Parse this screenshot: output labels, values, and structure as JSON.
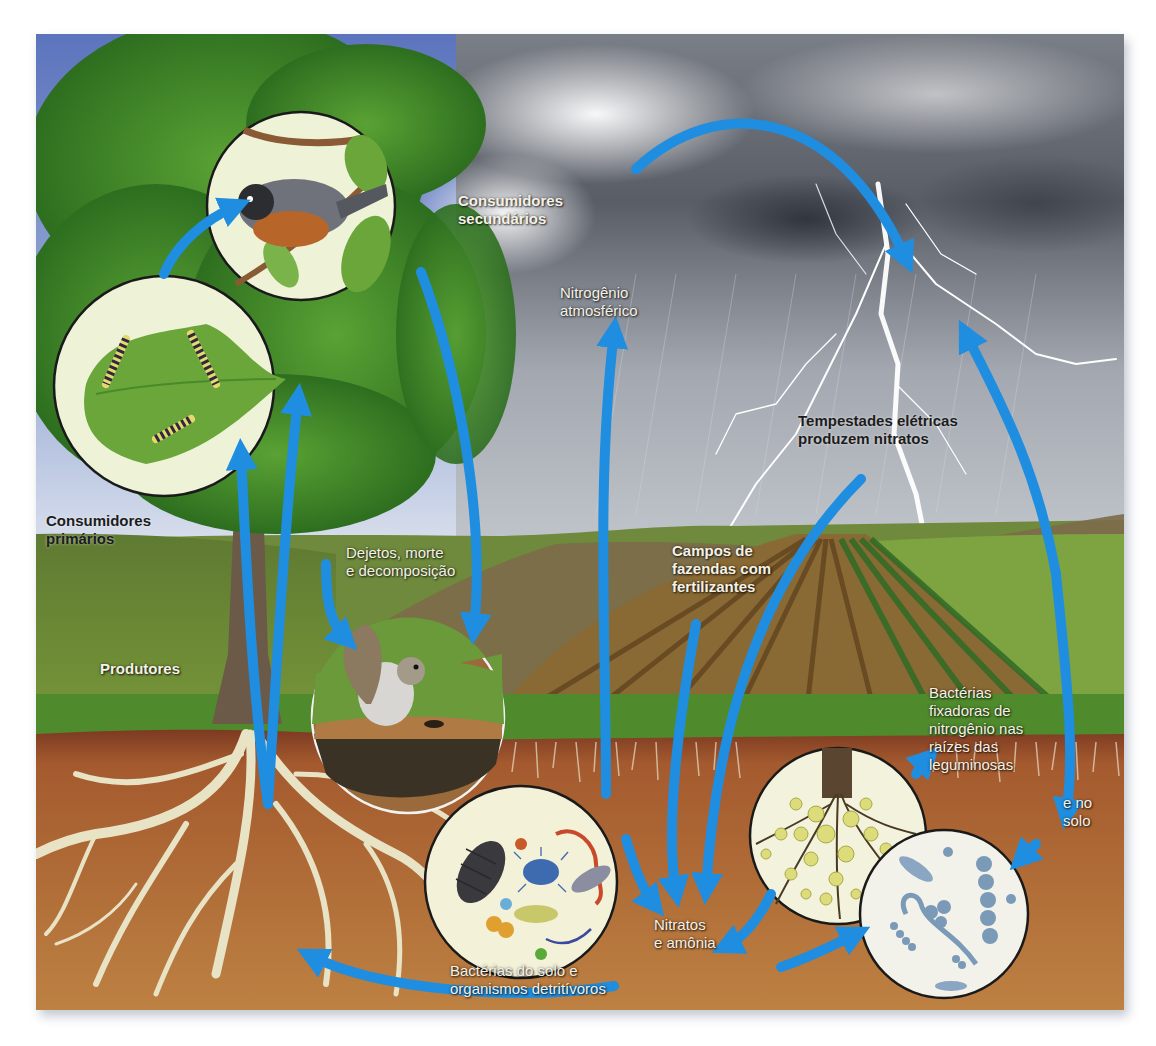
{
  "diagram": {
    "arrow_color": "#1f8ee0",
    "labels": {
      "secondary_consumers": "Consumidores\nsecundários",
      "atmospheric_nitrogen": "Nitrogênio\natmosférico",
      "electrical_storms": "Tempestades elétricas\nproduzem nitratos",
      "primary_consumers": "Consumidores\nprimários",
      "producers": "Produtores",
      "waste_death_decomposition": "Dejetos, morte\ne decomposição",
      "fertilized_farm_fields": "Campos de\nfazendas com\nfertilizantes",
      "legume_root_bacteria": "Bactérias\nfixadoras de\nnitrogênio nas\nraízes das\nleguminosas",
      "and_in_soil": "e no\nsolo",
      "nitrates_ammonia": "Nitratos\ne amônia",
      "soil_bacteria_detritivores": "Bactérias do solo e\norganismos detritívoros"
    },
    "insets": [
      {
        "id": "bird",
        "subject": "pássaro (consumidor secundário)"
      },
      {
        "id": "caterpillars",
        "subject": "lagartas em folha (consumidores primários)"
      },
      {
        "id": "squirrel",
        "subject": "esquilo (dejetos e decomposição)"
      },
      {
        "id": "soil-organisms",
        "subject": "organismos do solo e detritívoros"
      },
      {
        "id": "root-nodules",
        "subject": "nódulos de raízes de leguminosas"
      },
      {
        "id": "soil-bacteria",
        "subject": "bactérias fixadoras no solo"
      }
    ],
    "colors": {
      "sky_blue": "#6d84c4",
      "storm_gray": "#8f949c",
      "foliage_green": "#3f8a2a",
      "grass_green": "#6c8a36",
      "soil_brown": "#b77a3e",
      "root_cream": "#e9e3c6",
      "inset_bg": "#f3f3dc"
    }
  }
}
